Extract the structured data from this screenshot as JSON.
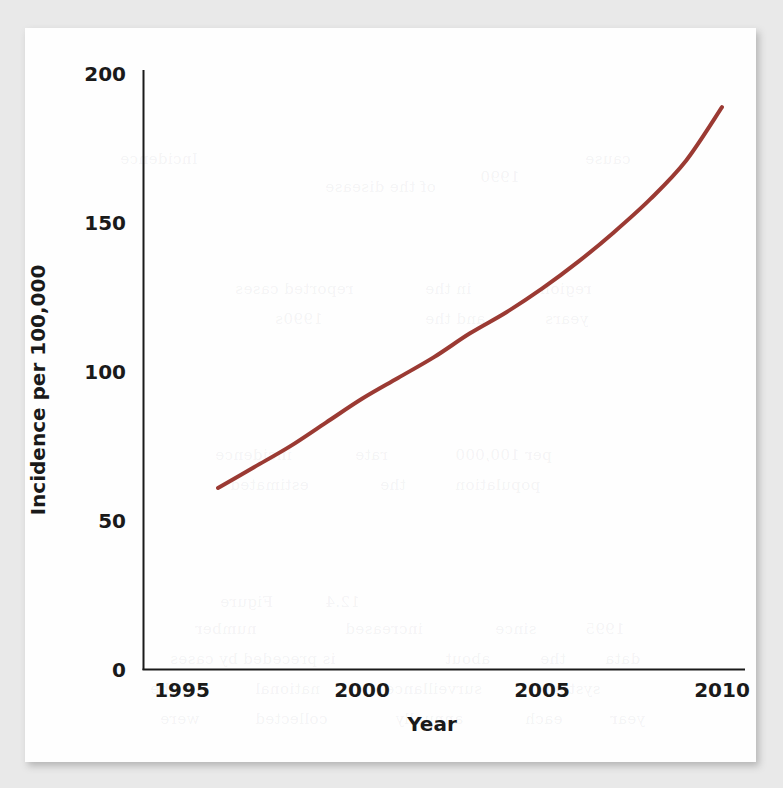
{
  "chart_data": {
    "type": "line",
    "title": "",
    "subtitle": "",
    "xlabel": "Year",
    "ylabel": "Incidence per 100,000",
    "xlim": [
      1995,
      2010.2
    ],
    "ylim": [
      0,
      200
    ],
    "xticks": [
      "1995",
      "2000",
      "2005",
      "2010"
    ],
    "xtick_values": [
      1995,
      2000,
      2005,
      2010
    ],
    "yticks": [
      "0",
      "50",
      "100",
      "150",
      "200"
    ],
    "ytick_values": [
      0,
      50,
      100,
      150,
      200
    ],
    "grid": false,
    "legend": "none",
    "series": [
      {
        "name": "Incidence",
        "color": "#9b3a33",
        "line_width": 4,
        "x": [
          1996.0,
          1997.0,
          1998.0,
          1999.0,
          2000.0,
          2001.0,
          2002.0,
          2003.0,
          2004.0,
          2005.0,
          2006.0,
          2007.0,
          2008.0,
          2009.0,
          2010.0
        ],
        "values": [
          61,
          68,
          75,
          83,
          91,
          98,
          105,
          113,
          120,
          128,
          137,
          147,
          158,
          171,
          189
        ]
      }
    ],
    "annotations": []
  },
  "figure": {
    "axis_color": "#1a1a1a",
    "axis_width": 2,
    "background": "#fefefe",
    "page_background": "#e9e9e9"
  },
  "bleed_through": [
    {
      "text": "Incidence",
      "left": 95,
      "top": 122
    },
    {
      "text": "of the disease",
      "left": 300,
      "top": 150
    },
    {
      "text": "1990",
      "left": 455,
      "top": 140
    },
    {
      "text": "cause",
      "left": 560,
      "top": 122
    },
    {
      "text": "reported cases",
      "left": 210,
      "top": 252
    },
    {
      "text": "in the",
      "left": 400,
      "top": 252
    },
    {
      "text": "region",
      "left": 515,
      "top": 252
    },
    {
      "text": "1990s",
      "left": 250,
      "top": 282
    },
    {
      "text": "and the",
      "left": 400,
      "top": 282
    },
    {
      "text": "years",
      "left": 520,
      "top": 282
    },
    {
      "text": "incidence",
      "left": 190,
      "top": 418
    },
    {
      "text": "rate",
      "left": 330,
      "top": 418
    },
    {
      "text": "per 100,000",
      "left": 430,
      "top": 418
    },
    {
      "text": "estimated",
      "left": 205,
      "top": 448
    },
    {
      "text": "the",
      "left": 355,
      "top": 448
    },
    {
      "text": "population",
      "left": 430,
      "top": 448
    },
    {
      "text": "Figure",
      "left": 195,
      "top": 565
    },
    {
      "text": "12.4",
      "left": 300,
      "top": 565
    },
    {
      "text": "number",
      "left": 170,
      "top": 592
    },
    {
      "text": "increased",
      "left": 320,
      "top": 592
    },
    {
      "text": "since",
      "left": 470,
      "top": 592
    },
    {
      "text": "1995",
      "left": 560,
      "top": 592
    },
    {
      "text": "is preceded by cases",
      "left": 145,
      "top": 622
    },
    {
      "text": "about",
      "left": 420,
      "top": 622
    },
    {
      "text": "the",
      "left": 515,
      "top": 622
    },
    {
      "text": "data",
      "left": 580,
      "top": 622
    },
    {
      "text": "in the",
      "left": 125,
      "top": 652
    },
    {
      "text": "national",
      "left": 230,
      "top": 652
    },
    {
      "text": "surveillance",
      "left": 360,
      "top": 652
    },
    {
      "text": "system",
      "left": 520,
      "top": 652
    },
    {
      "text": "were",
      "left": 135,
      "top": 682
    },
    {
      "text": "collected",
      "left": 230,
      "top": 682
    },
    {
      "text": "annually",
      "left": 370,
      "top": 682
    },
    {
      "text": "each",
      "left": 500,
      "top": 682
    },
    {
      "text": "year",
      "left": 585,
      "top": 682
    }
  ]
}
